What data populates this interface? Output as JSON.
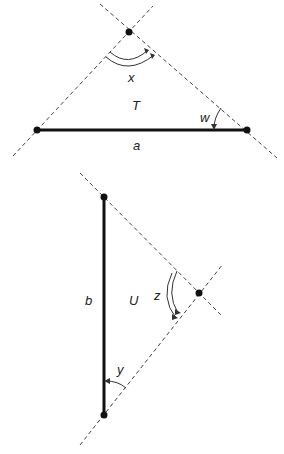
{
  "figure_top": {
    "name": "triangle-T",
    "region_label": "T",
    "segment_label": "a",
    "angle_labels": {
      "apex": "x",
      "right": "w"
    },
    "points": {
      "apex": [
        129,
        32
      ],
      "left": [
        37,
        130
      ],
      "right": [
        247,
        130
      ]
    }
  },
  "figure_bottom": {
    "name": "triangle-U",
    "region_label": "U",
    "segment_label": "b",
    "angle_labels": {
      "right_vertex": "z",
      "bottom": "y"
    },
    "points": {
      "top": [
        104,
        197
      ],
      "bottom": [
        104,
        415
      ],
      "vertex": [
        199,
        293
      ]
    }
  },
  "colors": {
    "line": "#111111",
    "dash": "#444444",
    "background": "#ffffff"
  }
}
